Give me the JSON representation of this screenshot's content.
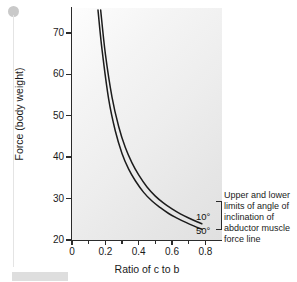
{
  "chart_data": {
    "type": "line",
    "title": "",
    "xlabel": "Ratio of c to b",
    "ylabel": "Force (body weight)",
    "xlim": [
      0,
      0.9
    ],
    "ylim": [
      20,
      76
    ],
    "grid": false,
    "legend_position": "right-inline",
    "x_ticks": [
      "0",
      "0.2",
      "0.4",
      "0.6",
      "0.8"
    ],
    "x_tick_values": [
      0,
      0.2,
      0.4,
      0.6,
      0.8
    ],
    "x_minor_tick_values": [
      0.1,
      0.3,
      0.5,
      0.7
    ],
    "y_ticks": [
      "20",
      "30",
      "40",
      "50",
      "60",
      "70"
    ],
    "y_tick_values": [
      20,
      30,
      40,
      50,
      60,
      70
    ],
    "series": [
      {
        "name": "10°",
        "label": "10°",
        "color": "#1c1c1c",
        "x": [
          0.172,
          0.2,
          0.24,
          0.28,
          0.32,
          0.36,
          0.4,
          0.45,
          0.5,
          0.55,
          0.6,
          0.65,
          0.7,
          0.75,
          0.78
        ],
        "y": [
          75.5,
          65.0,
          54.5,
          47.4,
          42.3,
          38.6,
          35.7,
          32.8,
          30.6,
          28.9,
          27.5,
          26.3,
          25.3,
          24.4,
          23.9
        ]
      },
      {
        "name": "50°",
        "label": "50°",
        "color": "#1c1c1c",
        "x": [
          0.156,
          0.18,
          0.22,
          0.26,
          0.3,
          0.34,
          0.38,
          0.43,
          0.48,
          0.53,
          0.58,
          0.63,
          0.68,
          0.73,
          0.78
        ],
        "y": [
          75.5,
          66.0,
          54.0,
          46.3,
          40.9,
          37.1,
          34.3,
          31.5,
          29.4,
          27.8,
          26.4,
          25.3,
          24.3,
          23.4,
          22.6
        ]
      }
    ],
    "annotations": [
      {
        "id": "limits-note",
        "text": "Upper and lower limits of angle of inclination of abductor muscle force line"
      }
    ]
  },
  "axes": {
    "y_title": "Force (body weight)",
    "x_title": "Ratio of c to b"
  },
  "ticks": {
    "y": [
      {
        "label": "70",
        "value": 70
      },
      {
        "label": "60",
        "value": 60
      },
      {
        "label": "50",
        "value": 50
      },
      {
        "label": "40",
        "value": 40
      },
      {
        "label": "30",
        "value": 30
      },
      {
        "label": "20",
        "value": 20
      }
    ],
    "x": [
      {
        "label": "0",
        "value": 0
      },
      {
        "label": "0.2",
        "value": 0.2
      },
      {
        "label": "0.4",
        "value": 0.4
      },
      {
        "label": "0.6",
        "value": 0.6
      },
      {
        "label": "0.8",
        "value": 0.8
      }
    ]
  },
  "series_labels": {
    "upper": "10°",
    "lower": "50°"
  },
  "annotation": {
    "text": "Upper and lower limits of angle of inclination of abductor muscle force line"
  },
  "colors": {
    "curve": "#1c1c1c",
    "axis": "#2b2b2b",
    "text": "#1a1a1a",
    "plot_background_light": "#fdfdfd",
    "plot_background_dark": "#e0e0e0"
  }
}
